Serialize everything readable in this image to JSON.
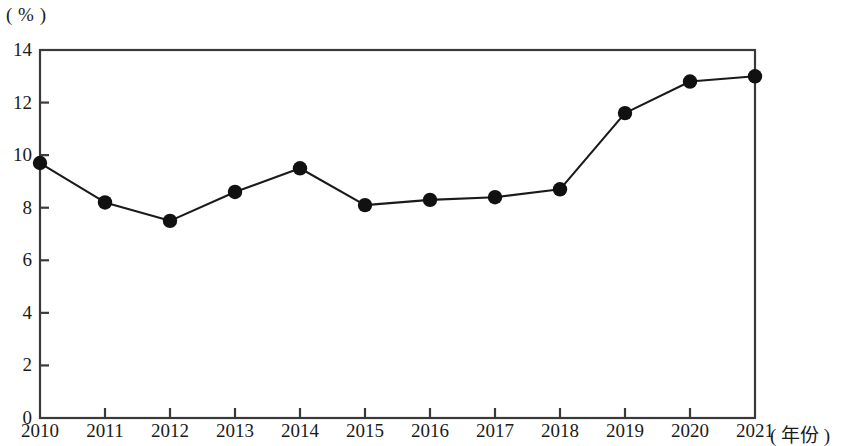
{
  "chart_data": {
    "type": "line",
    "title": "",
    "subtitle": "",
    "xlabel": "( 年份 )",
    "ylabel": "( % )",
    "categories": [
      "2010",
      "2011",
      "2012",
      "2013",
      "2014",
      "2015",
      "2016",
      "2017",
      "2018",
      "2019",
      "2020",
      "2021"
    ],
    "values": [
      9.7,
      8.2,
      7.5,
      8.6,
      9.5,
      8.1,
      8.3,
      8.4,
      8.7,
      11.6,
      12.8,
      13.0
    ],
    "series": [
      {
        "name": "",
        "values": [
          9.7,
          8.2,
          7.5,
          8.6,
          9.5,
          8.1,
          8.3,
          8.4,
          8.7,
          11.6,
          12.8,
          13.0
        ]
      }
    ],
    "x": [
      2010,
      2011,
      2012,
      2013,
      2014,
      2015,
      2016,
      2017,
      2018,
      2019,
      2020,
      2021
    ],
    "ylim": [
      0,
      14
    ],
    "xlim": [
      2010,
      2021
    ],
    "yticks": [
      0,
      2,
      4,
      6,
      8,
      10,
      12,
      14
    ],
    "ytick_labels": [
      "0",
      "2",
      "4",
      "6",
      "8",
      "10",
      "12",
      "14"
    ],
    "xtick_labels": [
      "2010",
      "2011",
      "2012",
      "2013",
      "2014",
      "2015",
      "2016",
      "2017",
      "2018",
      "2019",
      "2020",
      "2021"
    ],
    "grid": false,
    "legend": null,
    "legend_position": "none",
    "marker": "filled-circle",
    "line_color": "#1a1a1a",
    "marker_color": "#111111",
    "axis_color": "#3a3a3a",
    "background_color": "#ffffff",
    "annotations": []
  },
  "axes": {
    "y_unit_label": "( % )",
    "x_axis_title": "( 年份 )"
  }
}
